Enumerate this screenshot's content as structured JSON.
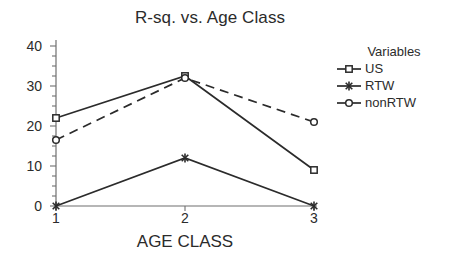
{
  "chart_data": {
    "type": "line",
    "title": "R-sq. vs. Age Class",
    "xlabel": "AGE CLASS",
    "ylabel": "",
    "categories": [
      "1",
      "2",
      "3"
    ],
    "x": [
      1,
      2,
      3
    ],
    "ylim": [
      0,
      40
    ],
    "xlim": [
      1,
      3
    ],
    "yticks": [
      "0",
      "10",
      "20",
      "30",
      "40"
    ],
    "ytick_values": [
      0,
      10,
      20,
      30,
      40
    ],
    "minor_tick_step": 2.5,
    "grid": false,
    "legend_position": "right",
    "legend_title": "Variables",
    "series": [
      {
        "name": "US",
        "values": [
          22,
          32.5,
          9
        ],
        "marker": "square",
        "linestyle": "solid",
        "color": "#2b2b2b"
      },
      {
        "name": "RTW",
        "values": [
          0,
          12,
          0
        ],
        "marker": "asterisk",
        "linestyle": "solid",
        "color": "#2b2b2b"
      },
      {
        "name": "nonRTW",
        "values": [
          16.5,
          32,
          21
        ],
        "marker": "circle",
        "linestyle": "dashed",
        "color": "#2b2b2b"
      }
    ]
  },
  "colors": {
    "ink": "#2b2b2b",
    "axis": "#6f6f6f",
    "background": "#ffffff"
  }
}
